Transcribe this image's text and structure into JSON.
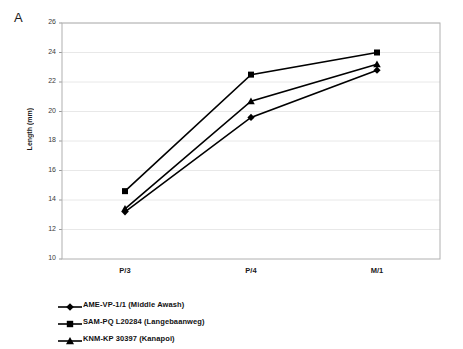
{
  "figure": {
    "panel_label": "A",
    "background_color": "#ffffff",
    "plot_border_color": "#b0b0b0",
    "gridline_color": "#e8e8e8",
    "series_color": "#000000"
  },
  "chart_data": {
    "type": "line",
    "title": "",
    "xlabel": "",
    "ylabel": "Length (mm)",
    "categories": [
      "P/3",
      "P/4",
      "M/1"
    ],
    "ylim": [
      10,
      26
    ],
    "yticks": [
      10,
      12,
      14,
      16,
      18,
      20,
      22,
      24,
      26
    ],
    "grid": true,
    "legend_position": "below",
    "series": [
      {
        "name": "AME-VP-1/1 (Middle Awash)",
        "marker": "diamond",
        "values": [
          13.2,
          19.6,
          22.8
        ]
      },
      {
        "name": "SAM-PQ L20284 (Langebaanweg)",
        "marker": "square",
        "values": [
          14.6,
          22.5,
          24.0
        ]
      },
      {
        "name": "KNM-KP 30397 (Kanapoi)",
        "marker": "triangle",
        "values": [
          13.4,
          20.7,
          23.2
        ]
      }
    ]
  }
}
